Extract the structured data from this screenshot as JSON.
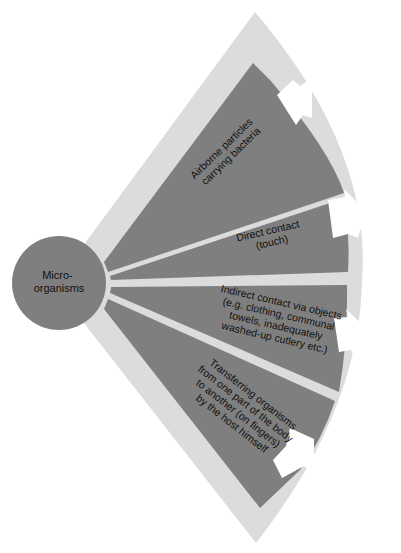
{
  "colors": {
    "background": "#ffffff",
    "fan": "#dcdcdc",
    "wedge": "#7f7f7f",
    "hub": "#7f7f7f",
    "arrow": "#ffffff",
    "text": "#111111"
  },
  "hub": {
    "lines": [
      "Micro-",
      "organisms"
    ]
  },
  "wedges": [
    {
      "id": "airborne",
      "lines": [
        "Airborne particles",
        "carrying bacteria"
      ],
      "arrow_icon": "arrow-right-icon"
    },
    {
      "id": "direct",
      "lines": [
        "Direct contact",
        "(touch)"
      ],
      "arrow_icon": "arrow-right-icon"
    },
    {
      "id": "indirect",
      "lines": [
        "Indirect contact via objects",
        "(e.g. clothing, communal",
        "towels, inadequately",
        "washed-up cutlery etc.)"
      ],
      "arrow_icon": "arrow-right-icon"
    },
    {
      "id": "self",
      "lines": [
        "Transferring organisms",
        "from one part of the body",
        "to another (on fingers)",
        "by the host himself"
      ],
      "arrow_icon": "arrow-right-icon"
    }
  ]
}
